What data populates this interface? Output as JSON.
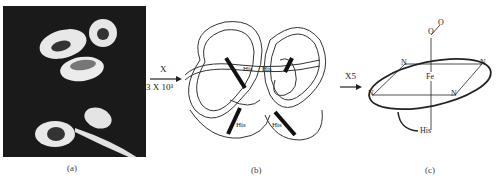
{
  "figure": {
    "panels": [
      {
        "id": "a",
        "caption": "(a)",
        "content": "red blood cells (micrograph, incl. sickled cell)"
      },
      {
        "id": "b",
        "caption": "(b)",
        "content": "hemoglobin protein ribbon diagram",
        "labels": [
          "His",
          "His",
          "His",
          "His"
        ]
      },
      {
        "id": "c",
        "caption": "(c)",
        "content": "heme group",
        "labels": {
          "oxygen_top": "O",
          "oxygen_bottom": "O",
          "iron": "Fe",
          "nitrogens": [
            "N",
            "N",
            "N",
            "N"
          ],
          "histidine": "His"
        }
      }
    ],
    "arrows": [
      {
        "from": "a",
        "to": "b",
        "label_top": "X",
        "label_bottom": "3 X 10³"
      },
      {
        "from": "b",
        "to": "c",
        "label_top": "X5"
      }
    ]
  }
}
